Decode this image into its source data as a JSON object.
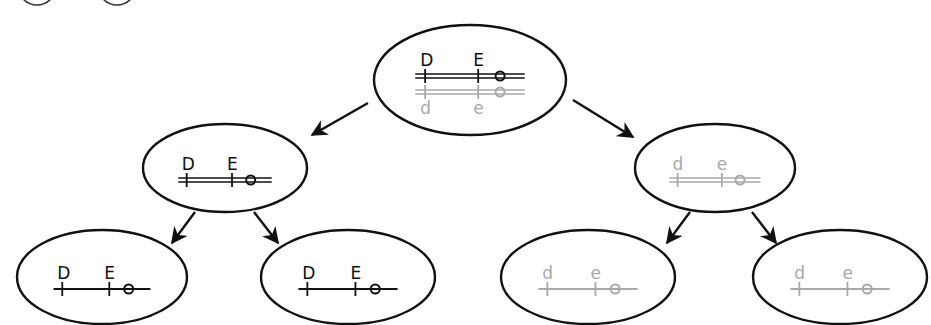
{
  "diagram": {
    "title": "",
    "colors": {
      "dark": "#111111",
      "light": "#a8a8a8",
      "outline": "#111111"
    },
    "corner_circles": [
      {
        "cx": 37,
        "label": ""
      },
      {
        "cx": 117,
        "label": ""
      }
    ],
    "nodes": [
      {
        "id": "root",
        "cx": 470,
        "cy": 80,
        "rx": 96,
        "ry": 55,
        "tracks": [
          {
            "tone": "dark",
            "double": true,
            "labels": [
              "D",
              "E"
            ],
            "label_pos": "above"
          },
          {
            "tone": "light",
            "double": true,
            "labels": [
              "d",
              "e"
            ],
            "label_pos": "below"
          }
        ]
      },
      {
        "id": "left",
        "cx": 225,
        "cy": 168,
        "rx": 82,
        "ry": 44,
        "tracks": [
          {
            "tone": "dark",
            "double": true,
            "labels": [
              "D",
              "E"
            ],
            "label_pos": "above"
          }
        ]
      },
      {
        "id": "right",
        "cx": 715,
        "cy": 168,
        "rx": 80,
        "ry": 44,
        "tracks": [
          {
            "tone": "light",
            "double": true,
            "labels": [
              "d",
              "e"
            ],
            "label_pos": "above"
          }
        ]
      },
      {
        "id": "ll",
        "cx": 102,
        "cy": 277,
        "rx": 85,
        "ry": 47,
        "tracks": [
          {
            "tone": "dark",
            "double": false,
            "labels": [
              "D",
              "E"
            ],
            "label_pos": "above"
          }
        ]
      },
      {
        "id": "lr",
        "cx": 348,
        "cy": 277,
        "rx": 87,
        "ry": 47,
        "tracks": [
          {
            "tone": "dark",
            "double": false,
            "labels": [
              "D",
              "E"
            ],
            "label_pos": "above"
          }
        ]
      },
      {
        "id": "rl",
        "cx": 588,
        "cy": 277,
        "rx": 87,
        "ry": 47,
        "tracks": [
          {
            "tone": "light",
            "double": false,
            "labels": [
              "d",
              "e"
            ],
            "label_pos": "above"
          }
        ]
      },
      {
        "id": "rr",
        "cx": 840,
        "cy": 277,
        "rx": 87,
        "ry": 47,
        "tracks": [
          {
            "tone": "light",
            "double": false,
            "labels": [
              "d",
              "e"
            ],
            "label_pos": "above"
          }
        ]
      }
    ],
    "edges": [
      {
        "from": "root",
        "to": "left",
        "x1": 368,
        "y1": 103,
        "x2": 312,
        "y2": 135
      },
      {
        "from": "root",
        "to": "right",
        "x1": 573,
        "y1": 100,
        "x2": 633,
        "y2": 137
      },
      {
        "from": "left",
        "to": "ll",
        "x1": 195,
        "y1": 212,
        "x2": 172,
        "y2": 243
      },
      {
        "from": "left",
        "to": "lr",
        "x1": 254,
        "y1": 212,
        "x2": 278,
        "y2": 243
      },
      {
        "from": "right",
        "to": "rl",
        "x1": 690,
        "y1": 212,
        "x2": 667,
        "y2": 243
      },
      {
        "from": "right",
        "to": "rr",
        "x1": 752,
        "y1": 212,
        "x2": 776,
        "y2": 243
      }
    ]
  }
}
